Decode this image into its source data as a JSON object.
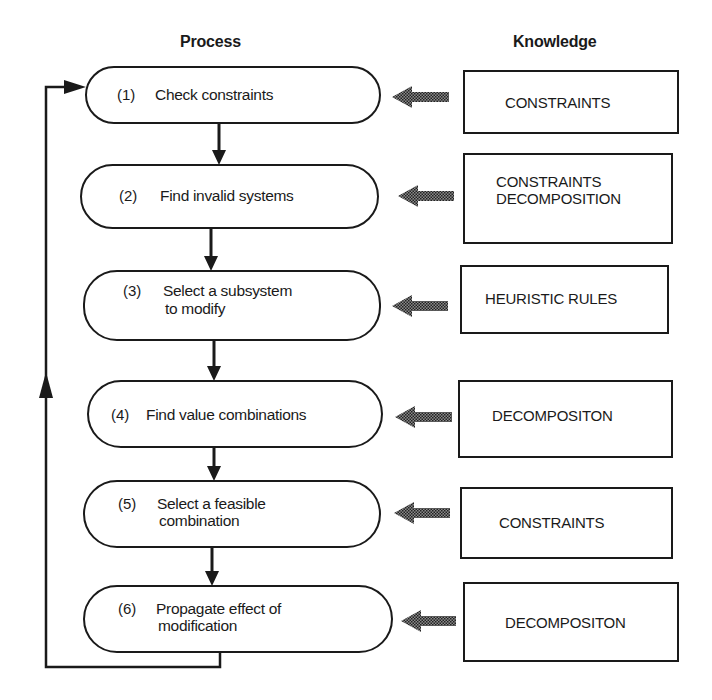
{
  "headers": {
    "process": "Process",
    "knowledge": "Knowledge"
  },
  "process_steps": [
    {
      "num": "(1)",
      "line1": "Check constraints",
      "line2": ""
    },
    {
      "num": "(2)",
      "line1": "Find invalid systems",
      "line2": ""
    },
    {
      "num": "(3)",
      "line1": "Select a subsystem",
      "line2": "to modify"
    },
    {
      "num": "(4)",
      "line1": "Find value combinations",
      "line2": ""
    },
    {
      "num": "(5)",
      "line1": "Select a feasible",
      "line2": "combination"
    },
    {
      "num": "(6)",
      "line1": "Propagate effect of",
      "line2": "modification"
    }
  ],
  "knowledge_boxes": [
    {
      "line1": "CONSTRAINTS",
      "line2": ""
    },
    {
      "line1": "CONSTRAINTS",
      "line2": "DECOMPOSITION"
    },
    {
      "line1": "HEURISTIC RULES",
      "line2": ""
    },
    {
      "line1": "DECOMPOSITON",
      "line2": ""
    },
    {
      "line1": "CONSTRAINTS",
      "line2": ""
    },
    {
      "line1": "DECOMPOSITON",
      "line2": ""
    }
  ],
  "icons": {
    "knowledge_arrow": "shaded-left-arrow-icon",
    "flow_arrow": "down-arrow-icon",
    "feedback_arrow": "loop-back-arrow-icon"
  },
  "colors": {
    "line": "#1a1a1a",
    "shaded_arrow": "#555555",
    "background": "#ffffff"
  }
}
